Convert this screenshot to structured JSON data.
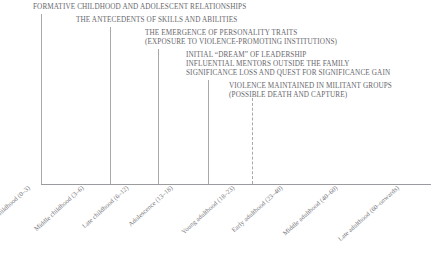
{
  "figure": {
    "type": "timeline-diagram",
    "orientation": "horizontal",
    "baseline_color": "#9a9a9f",
    "text_color": "#67676c"
  },
  "captions": [
    {
      "text": "FORMATIVE CHILDHOOD AND ADOLESCENT RELATIONSHIPS"
    },
    {
      "text": "THE ANTECEDENTS OF SKILLS AND ABILITIES"
    },
    {
      "text": "THE EMERGENCE OF PERSONALITY TRAITS"
    },
    {
      "text": "(EXPOSURE TO VIOLENCE-PROMOTING INSTITUTIONS)"
    },
    {
      "text": "INITIAL “DREAM” OF LEADERSHIP"
    },
    {
      "text": "INFLUENTIAL MENTORS OUTSIDE THE FAMILY"
    },
    {
      "text": "SIGNIFICANCE LOSS AND QUEST FOR SIGNIFICANCE GAIN"
    },
    {
      "text": "VIOLENCE MAINTAINED IN MILITANT GROUPS"
    },
    {
      "text": "(POSSIBLE DEATH AND CAPTURE)"
    }
  ],
  "rules": [
    {
      "style": "solid"
    },
    {
      "style": "solid"
    },
    {
      "style": "solid"
    },
    {
      "style": "solid"
    },
    {
      "style": "dashed"
    }
  ],
  "stages": [
    {
      "label": "Early childhood (0–3)"
    },
    {
      "label": "Middle childhood (3–6)"
    },
    {
      "label": "Late childhood (6–12)"
    },
    {
      "label": "Adolescence (13–18)"
    },
    {
      "label": "Young adulthood (18–23)"
    },
    {
      "label": "Early adulthood (23–40)"
    },
    {
      "label": "Middle adulthood (40–60)"
    },
    {
      "label": "Late adulthood (60–onwards)"
    }
  ]
}
